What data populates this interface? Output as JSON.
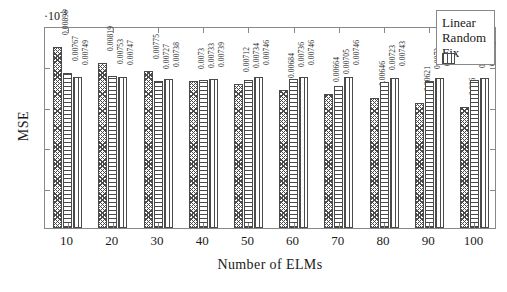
{
  "chart_data": {
    "type": "bar",
    "title": "",
    "xlabel": "Number of ELMs",
    "ylabel": "MSE",
    "y_multiplier": "·10",
    "y_multiplier_exponent": "-3",
    "categories": [
      "10",
      "20",
      "30",
      "40",
      "50",
      "60",
      "70",
      "80",
      "90",
      "100"
    ],
    "ylim": [
      0,
      10
    ],
    "grid": false,
    "legend_position": "top-right",
    "series": [
      {
        "name": "Linear",
        "pattern": "diagonal-crosshatch",
        "values": [
          0.00898,
          0.00819,
          0.00775,
          0.0073,
          0.00712,
          0.00684,
          0.00664,
          0.00646,
          0.00621,
          0.006
        ],
        "labels": [
          "0.00898",
          "0.00819",
          "0.00775",
          "0.0073",
          "0.00712",
          "0.00684",
          "0.00664",
          "0.00646",
          "0.00621",
          "0.006"
        ]
      },
      {
        "name": "Random",
        "pattern": "horizontal-lines",
        "values": [
          0.00767,
          0.00753,
          0.00727,
          0.00733,
          0.00734,
          0.00736,
          0.00705,
          0.00723,
          0.0073,
          0.00734
        ],
        "labels": [
          "0.00767",
          "0.00753",
          "0.00727",
          "0.00733",
          "0.00734",
          "0.00736",
          "0.00705",
          "0.00723",
          "0.0073",
          "0.00734"
        ]
      },
      {
        "name": "Fix",
        "pattern": "vertical-lines",
        "values": [
          0.00749,
          0.00747,
          0.00738,
          0.00739,
          0.00746,
          0.00746,
          0.00746,
          0.00743,
          0.00743,
          0.00742
        ],
        "labels": [
          "0.00749",
          "0.00747",
          "0.00738",
          "0.00739",
          "0.00746",
          "0.00746",
          "0.00746",
          "0.00743",
          "0.00743",
          "0.00742"
        ]
      }
    ]
  },
  "legend": {
    "entries": [
      {
        "label": "Linear"
      },
      {
        "label": "Random"
      },
      {
        "label": "Fix"
      }
    ]
  },
  "axes": {
    "y_label": "MSE",
    "x_label": "Number of ELMs"
  }
}
